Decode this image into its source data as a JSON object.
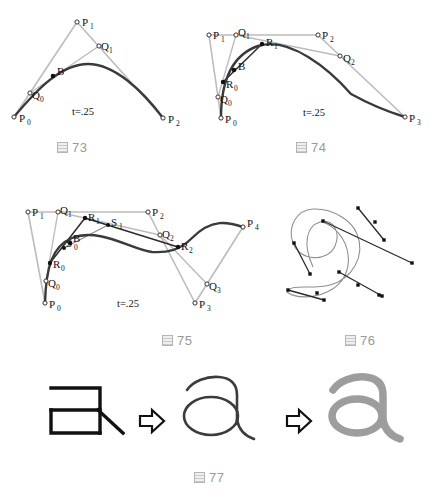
{
  "page": {
    "background": "#ffffff",
    "width": 439,
    "height": 492
  },
  "colors": {
    "control_polygon": "#bcbcbc",
    "curve_dark": "#3a3a3a",
    "construction_dark": "#2b2b2b",
    "caption_gray": "#9a9a9a",
    "glyph_black": "#111111",
    "glyph_gray": "#9d9d9d",
    "point_stroke": "#333333"
  },
  "figures": [
    {
      "id": "fig73",
      "caption_number": "73",
      "caption_glyph": "book-square-icon",
      "t_label": "t=.25",
      "degree": "quadratic",
      "points": [
        {
          "name": "P0",
          "base": "P",
          "sub": "0",
          "x": 14,
          "y": 117,
          "filled": false
        },
        {
          "name": "P1",
          "base": "P",
          "sub": "1",
          "x": 77,
          "y": 22,
          "filled": false
        },
        {
          "name": "P2",
          "base": "P",
          "sub": "2",
          "x": 163,
          "y": 118,
          "filled": false
        },
        {
          "name": "Q0",
          "base": "Q",
          "sub": "0",
          "x": 30,
          "y": 93,
          "filled": false
        },
        {
          "name": "Q1",
          "base": "Q",
          "sub": "1",
          "x": 99,
          "y": 46,
          "filled": false
        },
        {
          "name": "B",
          "base": "B",
          "sub": "",
          "x": 53,
          "y": 76,
          "filled": true
        }
      ],
      "control_polygon": [
        [
          "P0",
          "P1"
        ],
        [
          "P1",
          "P2"
        ]
      ],
      "construction_lines": [
        [
          "Q0",
          "Q1"
        ]
      ],
      "curve": "M14,117 C38,88 62,64 88,64 C114,64 142,90 163,118"
    },
    {
      "id": "fig74",
      "caption_number": "74",
      "caption_glyph": "book-square-icon",
      "t_label": "t=.25",
      "degree": "cubic",
      "points": [
        {
          "name": "P0",
          "base": "P",
          "sub": "0",
          "x": 221,
          "y": 118,
          "filled": false
        },
        {
          "name": "P1",
          "base": "P",
          "sub": "1",
          "x": 209,
          "y": 35,
          "filled": false
        },
        {
          "name": "P2",
          "base": "P",
          "sub": "2",
          "x": 318,
          "y": 35,
          "filled": false
        },
        {
          "name": "P3",
          "base": "P",
          "sub": "3",
          "x": 405,
          "y": 117,
          "filled": false
        },
        {
          "name": "Q0",
          "base": "Q",
          "sub": "0",
          "x": 218,
          "y": 97,
          "filled": false
        },
        {
          "name": "Q1",
          "base": "Q",
          "sub": "1",
          "x": 236,
          "y": 35,
          "filled": false
        },
        {
          "name": "Q2",
          "base": "Q",
          "sub": "2",
          "x": 340,
          "y": 56,
          "filled": false
        },
        {
          "name": "R0",
          "base": "R",
          "sub": "0",
          "x": 223,
          "y": 82,
          "filled": true
        },
        {
          "name": "R1",
          "base": "R",
          "sub": "1",
          "x": 262,
          "y": 44,
          "filled": true
        },
        {
          "name": "B",
          "base": "B",
          "sub": "",
          "x": 234,
          "y": 70,
          "filled": true
        }
      ],
      "control_polygon": [
        [
          "P0",
          "P1"
        ],
        [
          "P1",
          "P2"
        ],
        [
          "P2",
          "P3"
        ]
      ],
      "construction_lines": [
        [
          "Q0",
          "Q1"
        ],
        [
          "Q1",
          "Q2"
        ],
        [
          "R0",
          "R1"
        ]
      ],
      "curve": "M221,118 C221,80 232,55 258,46 C290,36 330,70 351,94 C371,105 392,113 405,117"
    },
    {
      "id": "fig75",
      "caption_number": "75",
      "caption_glyph": "book-square-icon",
      "t_label": "t=.25",
      "degree": "quartic",
      "points": [
        {
          "name": "P0",
          "base": "P",
          "sub": "0",
          "x": 45,
          "y": 303,
          "filled": false
        },
        {
          "name": "P1",
          "base": "P",
          "sub": "1",
          "x": 28,
          "y": 212,
          "filled": false
        },
        {
          "name": "P2",
          "base": "P",
          "sub": "2",
          "x": 148,
          "y": 212,
          "filled": false
        },
        {
          "name": "P3",
          "base": "P",
          "sub": "3",
          "x": 195,
          "y": 303,
          "filled": false
        },
        {
          "name": "P4",
          "base": "P",
          "sub": "4",
          "x": 243,
          "y": 227,
          "filled": false
        },
        {
          "name": "Q0",
          "base": "Q",
          "sub": "0",
          "x": 46,
          "y": 281,
          "filled": false
        },
        {
          "name": "Q1",
          "base": "Q",
          "sub": "1",
          "x": 58,
          "y": 212,
          "filled": false
        },
        {
          "name": "Q2",
          "base": "Q",
          "sub": "2",
          "x": 160,
          "y": 235,
          "filled": false
        },
        {
          "name": "Q3",
          "base": "Q",
          "sub": "3",
          "x": 207,
          "y": 284,
          "filled": false
        },
        {
          "name": "R0",
          "base": "R",
          "sub": "0",
          "x": 50,
          "y": 263,
          "filled": true
        },
        {
          "name": "R1",
          "base": "R",
          "sub": "1",
          "x": 85,
          "y": 218,
          "filled": true
        },
        {
          "name": "R2",
          "base": "R",
          "sub": "2",
          "x": 178,
          "y": 247,
          "filled": true
        },
        {
          "name": "S0",
          "base": "S",
          "sub": "0",
          "x": 64,
          "y": 248,
          "filled": true
        },
        {
          "name": "S1",
          "base": "S",
          "sub": "1",
          "x": 108,
          "y": 225,
          "filled": true
        },
        {
          "name": "B",
          "base": "B",
          "sub": "",
          "x": 70,
          "y": 243,
          "filled": true
        }
      ],
      "control_polygon": [
        [
          "P0",
          "P1"
        ],
        [
          "P1",
          "P2"
        ],
        [
          "P2",
          "P3"
        ],
        [
          "P3",
          "P4"
        ]
      ],
      "construction_lines": [
        [
          "Q0",
          "Q1"
        ],
        [
          "Q1",
          "Q2"
        ],
        [
          "Q2",
          "Q3"
        ],
        [
          "R0",
          "R1"
        ],
        [
          "R1",
          "R2"
        ],
        [
          "S0",
          "S1"
        ]
      ],
      "curve": "M45,303 C46,268 52,246 72,238 C100,227 132,250 152,252 C168,253 180,250 192,238 C212,218 228,222 243,227"
    },
    {
      "id": "fig76",
      "caption_number": "76",
      "caption_glyph": "book-square-icon",
      "description": "closed spline with control point tangent handles",
      "handles": [
        {
          "x1": 358,
          "y1": 208,
          "x2": 383,
          "y2": 239
        },
        {
          "x1": 375,
          "y1": 222,
          "x2": 384,
          "y2": 240
        },
        {
          "x1": 323,
          "y1": 221,
          "x2": 412,
          "y2": 263
        },
        {
          "x1": 294,
          "y1": 243,
          "x2": 310,
          "y2": 274
        },
        {
          "x1": 288,
          "y1": 290,
          "x2": 317,
          "y2": 293
        },
        {
          "x1": 309,
          "y1": 293,
          "x2": 324,
          "y2": 300
        },
        {
          "x1": 339,
          "y1": 272,
          "x2": 379,
          "y2": 295
        },
        {
          "x1": 358,
          "y1": 285,
          "x2": 382,
          "y2": 296
        }
      ],
      "dots": [
        {
          "x": 358,
          "y": 208
        },
        {
          "x": 383,
          "y": 239
        },
        {
          "x": 375,
          "y": 222
        },
        {
          "x": 323,
          "y": 221
        },
        {
          "x": 412,
          "y": 263
        },
        {
          "x": 294,
          "y": 243
        },
        {
          "x": 310,
          "y": 274
        },
        {
          "x": 288,
          "y": 290
        },
        {
          "x": 317,
          "y": 293
        },
        {
          "x": 309,
          "y": 293
        },
        {
          "x": 324,
          "y": 300
        },
        {
          "x": 339,
          "y": 272
        },
        {
          "x": 379,
          "y": 295
        },
        {
          "x": 358,
          "y": 285
        },
        {
          "x": 382,
          "y": 296
        }
      ]
    },
    {
      "id": "fig77",
      "caption_number": "77",
      "caption_glyph": "book-square-icon",
      "steps": [
        {
          "name": "skeleton-outline",
          "style": "black-polyline",
          "glyph": "a-skeleton"
        },
        {
          "name": "outline-a",
          "style": "thin-dark-outline",
          "glyph": "a"
        },
        {
          "name": "filled-a",
          "style": "thick-gray-stroke",
          "glyph": "a"
        }
      ],
      "arrows": [
        {
          "name": "arrow-1",
          "x": 140,
          "y": 422
        },
        {
          "name": "arrow-2",
          "x": 287,
          "y": 422
        }
      ]
    }
  ],
  "captions": [
    {
      "id": "cap73",
      "number": "73",
      "x": 57,
      "y": 142
    },
    {
      "id": "cap74",
      "number": "74",
      "x": 296,
      "y": 142
    },
    {
      "id": "cap75",
      "number": "75",
      "x": 162,
      "y": 333
    },
    {
      "id": "cap76",
      "number": "76",
      "x": 345,
      "y": 333
    },
    {
      "id": "cap77",
      "number": "77",
      "x": 194,
      "y": 470
    }
  ]
}
